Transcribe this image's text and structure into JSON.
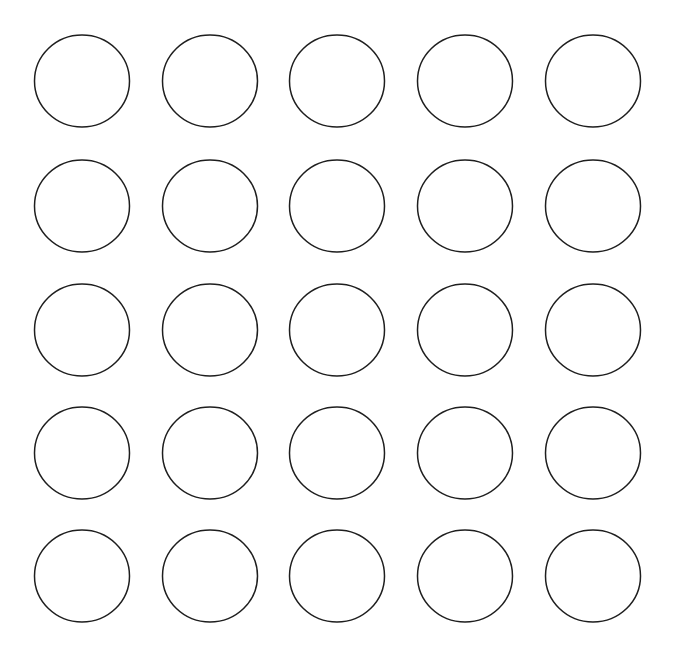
{
  "diagram": {
    "type": "circle-grid",
    "rows": 5,
    "columns": 5,
    "background": "#ffffff",
    "stroke_color": "#1e1e1e",
    "stroke_width": 1.5,
    "fill": "none",
    "shape": {
      "rx": 47.5,
      "ry": 46
    },
    "column_centers": [
      82,
      210,
      337,
      465,
      593
    ],
    "row_centers": [
      81,
      206,
      330,
      453,
      576
    ]
  }
}
